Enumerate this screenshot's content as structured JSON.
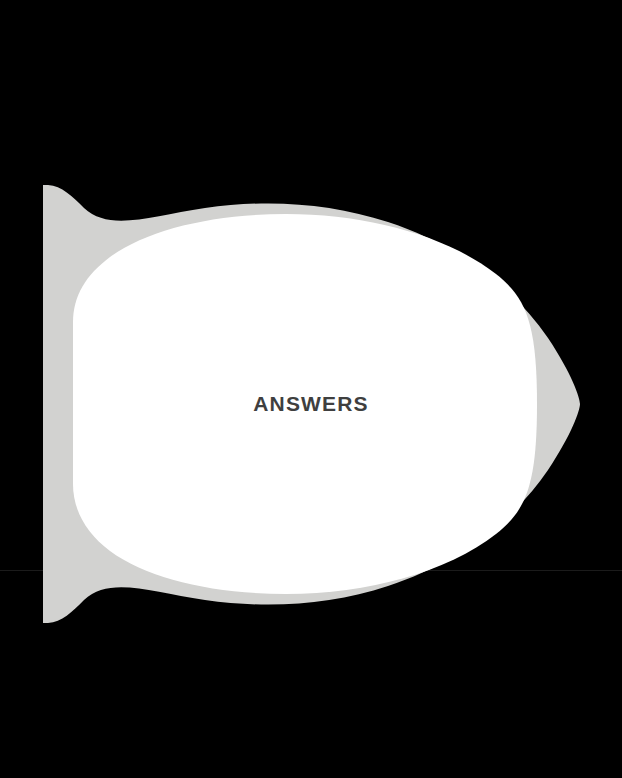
{
  "page": {
    "width": 622,
    "height": 778,
    "background_color": "#000000"
  },
  "scan_artifact": {
    "name": "horizontal-seam-line",
    "color": "#1b1b1b",
    "y": 570
  },
  "shape": {
    "name": "answers-tab-shape",
    "outer_color": "#d2d2d0",
    "inner_color": "#ffffff",
    "outer_bounds": {
      "left": 43,
      "top": 185,
      "right": 578,
      "bottom": 622
    },
    "inner_bounds": {
      "left": 73,
      "top": 228,
      "right": 535,
      "bottom": 580
    },
    "fin_tip_top": {
      "x": 48,
      "y": 185
    },
    "fin_tip_bottom": {
      "x": 48,
      "y": 622
    }
  },
  "label": {
    "text": "ANSWERS",
    "color": "#3f3f3f",
    "font_size_px": 21,
    "weight": "bold",
    "center": {
      "x": 294,
      "y": 405
    }
  }
}
